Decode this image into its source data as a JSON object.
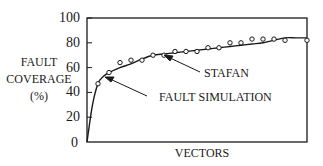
{
  "chart_data": {
    "type": "line",
    "title": "",
    "xlabel": "VECTORS",
    "ylabel": [
      "FAULT",
      "COVERAGE",
      "(%)"
    ],
    "ylim": [
      0,
      100
    ],
    "yticks": [
      0,
      20,
      40,
      60,
      80,
      100
    ],
    "xticks": [],
    "grid": false,
    "legend": null,
    "x": [
      0,
      1,
      2,
      3,
      4,
      5,
      6,
      7,
      8,
      9,
      10,
      11,
      12,
      13,
      14,
      15,
      16,
      17,
      18,
      19,
      20
    ],
    "series": [
      {
        "name": "FAULT SIMULATION",
        "style": "solid-line",
        "x": [
          0,
          0.5,
          1,
          1.5,
          2,
          3,
          4,
          5,
          6,
          7,
          8,
          9,
          10,
          11,
          12,
          13,
          14,
          15,
          16,
          17,
          18,
          19,
          20
        ],
        "values": [
          0,
          30,
          47,
          53,
          56,
          60,
          63,
          67,
          70,
          71,
          72,
          73,
          74,
          75,
          76,
          77,
          78,
          79,
          80,
          82,
          84,
          84,
          84
        ]
      },
      {
        "name": "STAFAN",
        "style": "markers-circle",
        "x": [
          1,
          2,
          3,
          4,
          5,
          6,
          7,
          8,
          9,
          10,
          11,
          12,
          13,
          14,
          15,
          16,
          17,
          18,
          20
        ],
        "values": [
          47,
          56,
          64,
          66,
          66,
          70,
          70,
          73,
          73,
          73,
          76,
          76,
          80,
          80,
          83,
          83,
          83,
          82,
          82
        ]
      }
    ],
    "annotations": [
      {
        "text": "STAFAN",
        "points_to": "STAFAN"
      },
      {
        "text": "FAULT SIMULATION",
        "points_to": "FAULT SIMULATION"
      }
    ]
  },
  "labels": {
    "y_ticks": [
      "100",
      "80",
      "60",
      "40",
      "20",
      "0"
    ],
    "ylabel_line1": "FAULT",
    "ylabel_line2": "COVERAGE",
    "ylabel_line3": "(%)",
    "xlabel": "VECTORS",
    "annot_stafan": "STAFAN",
    "annot_fault": "FAULT SIMULATION"
  },
  "colors": {
    "ink": "#1a1a1a",
    "background": "#ffffff"
  }
}
